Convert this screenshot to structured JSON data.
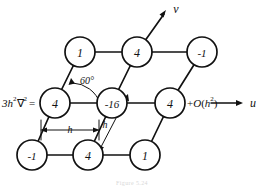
{
  "figure": {
    "kind": "finite-difference-stencil",
    "caption": "Figure 5.24",
    "left_label": "3h²∇² =",
    "right_label": "+O(h²)",
    "angle_label": "60°",
    "spacing_label_horizontal": "h",
    "spacing_label_diagonal": "h",
    "axes": {
      "horizontal_label": "u",
      "vertical_label": "v"
    },
    "colors": {
      "ink": "#111111",
      "paper": "#ffffff",
      "caption": "#d8d8d8"
    },
    "geometry": {
      "radius": 15,
      "col_spacing": 57,
      "row_spacing": 52,
      "row_skew": 27
    },
    "rows": [
      {
        "name": "top-row",
        "nodes": [
          {
            "id": "n-top-left",
            "value": "1",
            "cx": 80,
            "cy": 52
          },
          {
            "id": "n-top-mid",
            "value": "4",
            "cx": 137,
            "cy": 52
          },
          {
            "id": "n-top-right",
            "value": "-1",
            "cx": 202,
            "cy": 52
          }
        ]
      },
      {
        "name": "middle-row",
        "nodes": [
          {
            "id": "n-mid-left",
            "value": "4",
            "cx": 55,
            "cy": 103
          },
          {
            "id": "n-center",
            "value": "-16",
            "cx": 112,
            "cy": 103
          },
          {
            "id": "n-mid-right",
            "value": "4",
            "cx": 170,
            "cy": 103
          }
        ]
      },
      {
        "name": "bottom-row",
        "nodes": [
          {
            "id": "n-bot-left",
            "value": "-1",
            "cx": 32,
            "cy": 155
          },
          {
            "id": "n-bot-mid",
            "value": "4",
            "cx": 88,
            "cy": 155
          },
          {
            "id": "n-bot-right",
            "value": "1",
            "cx": 145,
            "cy": 155
          }
        ]
      }
    ],
    "values_flat": [
      "1",
      "4",
      "-1",
      "4",
      "-16",
      "4",
      "-1",
      "4",
      "1"
    ]
  }
}
